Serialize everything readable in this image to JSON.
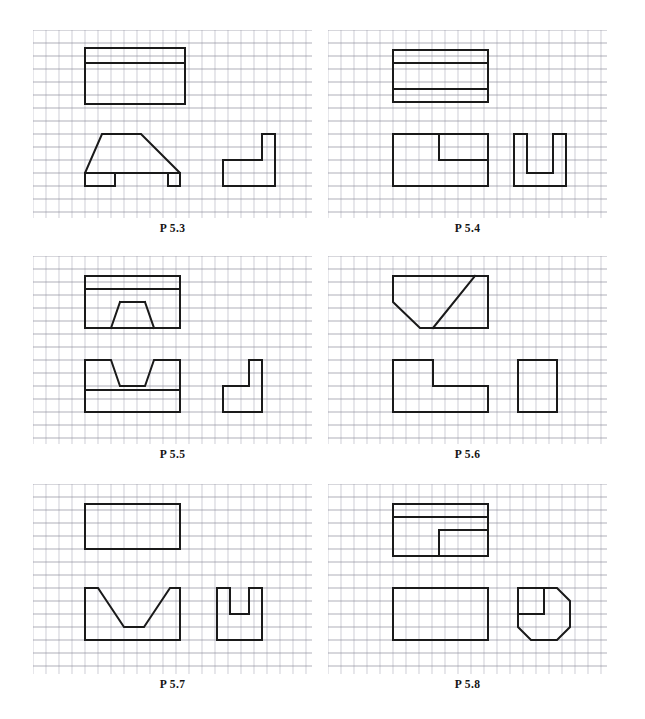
{
  "page": {
    "kind": "engineering-drawing-worksheet",
    "width": 645,
    "height": 719,
    "background_color": "#ffffff",
    "grid": {
      "cell_px": 13,
      "minor_color": "#b9b9c4",
      "major_color": "#8d8d9b",
      "major_every": 1,
      "line_width": 0.7
    },
    "outline": {
      "color": "#1a1a1a",
      "line_width": 2.0
    }
  },
  "panels": [
    {
      "id": "p53",
      "label": "P 5.3",
      "x": 33,
      "y": 30,
      "w": 279,
      "h": 188,
      "label_y": 222,
      "views": [
        {
          "name": "top-view",
          "role": "top",
          "points": "[[52,18],[152,18],[152,74],[52,74]]",
          "closed": true,
          "inner_lines": "[[[52,33],[152,33]]]"
        },
        {
          "name": "front-view",
          "role": "front",
          "points": "[[52,156],[52,143],[69,104],[108,104],[147,143],[147,156],[135,156],[135,143],[82,143],[82,156]]",
          "closed": true,
          "inner_lines": "[[[52,143],[147,143]]]"
        },
        {
          "name": "side-view",
          "role": "side",
          "points": "[[190,130],[229,130],[229,104],[242,104],[242,156],[190,156]]",
          "closed": true,
          "inner_lines": "[]"
        }
      ]
    },
    {
      "id": "p54",
      "label": "P 5.4",
      "x": 328,
      "y": 30,
      "w": 279,
      "h": 188,
      "label_y": 222,
      "views": [
        {
          "name": "top-view",
          "role": "top",
          "points": "[[65,20],[160,20],[160,72],[65,72]]",
          "closed": true,
          "inner_lines": "[[[65,33],[160,33]],[[65,59],[160,59]]]"
        },
        {
          "name": "front-view",
          "role": "front",
          "points": "[[65,104],[160,104],[160,156],[65,156]]",
          "closed": true,
          "inner_lines": "[[[111,104],[111,130]],[[111,130],[160,130]]]"
        },
        {
          "name": "side-view",
          "role": "side",
          "points": "[[186,104],[199,104],[199,143],[225,143],[225,104],[238,104],[238,156],[186,156]]",
          "closed": true,
          "inner_lines": "[]"
        }
      ]
    },
    {
      "id": "p55",
      "label": "P 5.5",
      "x": 33,
      "y": 256,
      "w": 279,
      "h": 188,
      "label_y": 448,
      "views": [
        {
          "name": "top-view",
          "role": "top",
          "points": "[[52,20],[147,20],[147,72],[52,72]]",
          "closed": true,
          "inner_lines": "[[[52,33],[147,33]],[[52,72],[78,72]],[[78,72],[87,46]],[[87,46],[112,46]],[[112,46],[121,72]],[[121,72],[147,72]]]"
        },
        {
          "name": "front-view",
          "role": "front",
          "points": "[[52,104],[78,104],[87,130],[112,130],[121,104],[147,104],[147,156],[52,156]]",
          "closed": true,
          "inner_lines": "[[[52,134],[147,134]]]"
        },
        {
          "name": "side-view",
          "role": "side",
          "points": "[[190,130],[216,130],[216,104],[229,104],[229,156],[190,156]]",
          "closed": true,
          "inner_lines": "[]"
        }
      ]
    },
    {
      "id": "p56",
      "label": "P 5.6",
      "x": 328,
      "y": 256,
      "w": 279,
      "h": 188,
      "label_y": 448,
      "views": [
        {
          "name": "top-view",
          "role": "top",
          "points": "[[65,20],[160,20],[160,72],[92,72],[65,46]]",
          "closed": true,
          "inner_lines": "[[[105,72],[147,20]]]"
        },
        {
          "name": "front-view",
          "role": "front",
          "points": "[[65,104],[105,104],[105,130],[160,130],[160,156],[65,156]]",
          "closed": true,
          "inner_lines": "[]"
        },
        {
          "name": "side-view",
          "role": "side",
          "points": "[[190,104],[229,104],[229,156],[190,156]]",
          "closed": true,
          "inner_lines": "[]"
        }
      ]
    },
    {
      "id": "p57",
      "label": "P 5.7",
      "x": 33,
      "y": 484,
      "w": 279,
      "h": 190,
      "label_y": 678,
      "views": [
        {
          "name": "top-view",
          "role": "top",
          "points": "[[52,20],[147,20],[147,65],[52,65]]",
          "closed": true,
          "inner_lines": "[]"
        },
        {
          "name": "front-view",
          "role": "front",
          "points": "[[52,104],[65,104],[91,143],[111,143],[137,104],[147,104],[147,156],[52,156]]",
          "closed": true,
          "inner_lines": "[]"
        },
        {
          "name": "side-view",
          "role": "side",
          "points": "[[184,104],[197,104],[197,130],[216,130],[216,104],[229,104],[229,156],[184,156]]",
          "closed": true,
          "inner_lines": "[]"
        }
      ]
    },
    {
      "id": "p58",
      "label": "P 5.8",
      "x": 328,
      "y": 484,
      "w": 279,
      "h": 190,
      "label_y": 678,
      "views": [
        {
          "name": "top-view",
          "role": "top",
          "points": "[[65,20],[160,20],[160,72],[65,72]]",
          "closed": true,
          "inner_lines": "[[[65,33],[160,33]],[[111,46],[160,46]],[[111,46],[111,72]]]"
        },
        {
          "name": "front-view",
          "role": "front",
          "points": "[[65,104],[160,104],[160,156],[65,156]]",
          "closed": true,
          "inner_lines": "[]"
        },
        {
          "name": "side-view",
          "role": "side",
          "points": "[[190,104],[229,104],[242,117],[242,143],[229,156],[203,156],[190,143]]",
          "closed": true,
          "inner_lines": "[[[190,130],[216,130]],[[216,104],[216,130]]]"
        }
      ]
    }
  ]
}
